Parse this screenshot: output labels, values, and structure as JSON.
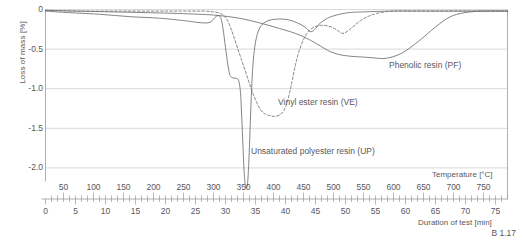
{
  "figure": {
    "caption": "B 1.17"
  },
  "chart_data": {
    "type": "line",
    "title": "",
    "ylabel": "Loss of mass [%]",
    "xlabel_top": "Temperature [°C]",
    "xlabel_bottom": "Duration of test [min]",
    "ylim": [
      -2.35,
      0.05
    ],
    "yticks": [
      0,
      -0.5,
      -1.0,
      -1.5,
      -2.0
    ],
    "ytick_labels": [
      "0",
      "-0.5",
      "-1.0",
      "-1.5",
      "-2.0"
    ],
    "grid": true,
    "legend_position": "inline-annotations",
    "x_top_axis": {
      "label": "Temperature [°C]",
      "range": [
        20,
        790
      ],
      "major_ticks": [
        50,
        100,
        150,
        200,
        250,
        300,
        350,
        400,
        450,
        500,
        550,
        600,
        650,
        700,
        750
      ],
      "tick_labels": [
        "50",
        "100",
        "150",
        "200",
        "250",
        "300",
        "350",
        "400",
        "450",
        "500",
        "550",
        "600",
        "650",
        "700",
        "750"
      ],
      "minor_tick_step": 10
    },
    "x_bottom_axis": {
      "label": "Duration of test [min]",
      "range": [
        0,
        76
      ],
      "major_ticks": [
        0,
        5,
        10,
        15,
        20,
        25,
        30,
        35,
        40,
        45,
        50,
        55,
        60,
        65,
        70,
        75
      ],
      "tick_labels": [
        "0",
        "5",
        "10",
        "15",
        "20",
        "25",
        "30",
        "35",
        "40",
        "45",
        "50",
        "55",
        "60",
        "65",
        "70",
        "75"
      ],
      "minor_tick_step": 1
    },
    "series": [
      {
        "name": "Unsaturated polyester resin (UP)",
        "short": "UP",
        "style": "solid",
        "color": "#6d6e70",
        "annotation": "Unsaturated polyester resin (UP)",
        "min_value": -2.25,
        "min_at_temperature": 352,
        "points": [
          [
            20,
            -0.02
          ],
          [
            60,
            -0.04
          ],
          [
            110,
            -0.06
          ],
          [
            160,
            -0.09
          ],
          [
            210,
            -0.11
          ],
          [
            250,
            -0.14
          ],
          [
            270,
            -0.16
          ],
          [
            285,
            -0.17
          ],
          [
            295,
            -0.16
          ],
          [
            300,
            -0.12
          ],
          [
            306,
            -0.08
          ],
          [
            312,
            -0.1
          ],
          [
            316,
            -0.25
          ],
          [
            320,
            -0.48
          ],
          [
            324,
            -0.7
          ],
          [
            327,
            -0.82
          ],
          [
            331,
            -0.86
          ],
          [
            338,
            -0.87
          ],
          [
            342,
            -0.9
          ],
          [
            345,
            -1.05
          ],
          [
            347,
            -1.35
          ],
          [
            349,
            -1.7
          ],
          [
            351,
            -2.05
          ],
          [
            353,
            -2.22
          ],
          [
            355,
            -2.25
          ],
          [
            357,
            -2.18
          ],
          [
            359,
            -1.9
          ],
          [
            361,
            -1.5
          ],
          [
            363,
            -1.1
          ],
          [
            365,
            -0.78
          ],
          [
            368,
            -0.52
          ],
          [
            372,
            -0.34
          ],
          [
            378,
            -0.22
          ],
          [
            386,
            -0.16
          ],
          [
            396,
            -0.13
          ],
          [
            410,
            -0.12
          ],
          [
            425,
            -0.13
          ],
          [
            440,
            -0.17
          ],
          [
            452,
            -0.22
          ],
          [
            462,
            -0.28
          ],
          [
            470,
            -0.24
          ],
          [
            478,
            -0.17
          ],
          [
            490,
            -0.11
          ],
          [
            505,
            -0.07
          ],
          [
            525,
            -0.04
          ],
          [
            550,
            -0.03
          ],
          [
            600,
            -0.02
          ],
          [
            660,
            -0.02
          ],
          [
            720,
            -0.02
          ],
          [
            790,
            -0.02
          ]
        ]
      },
      {
        "name": "Vinyl ester resin (VE)",
        "short": "VE",
        "style": "dashed",
        "color": "#6d6e70",
        "annotation": "Vinyl ester resin (VE)",
        "min_value": -1.35,
        "min_at_temperature": 403,
        "points": [
          [
            20,
            -0.01
          ],
          [
            80,
            -0.02
          ],
          [
            150,
            -0.02
          ],
          [
            220,
            -0.02
          ],
          [
            265,
            -0.02
          ],
          [
            285,
            -0.02
          ],
          [
            300,
            -0.03
          ],
          [
            312,
            -0.05
          ],
          [
            322,
            -0.12
          ],
          [
            330,
            -0.26
          ],
          [
            338,
            -0.44
          ],
          [
            346,
            -0.62
          ],
          [
            354,
            -0.8
          ],
          [
            362,
            -0.98
          ],
          [
            370,
            -1.14
          ],
          [
            378,
            -1.26
          ],
          [
            386,
            -1.32
          ],
          [
            394,
            -1.34
          ],
          [
            402,
            -1.35
          ],
          [
            410,
            -1.33
          ],
          [
            417,
            -1.28
          ],
          [
            424,
            -1.14
          ],
          [
            430,
            -0.94
          ],
          [
            436,
            -0.72
          ],
          [
            442,
            -0.54
          ],
          [
            450,
            -0.38
          ],
          [
            458,
            -0.28
          ],
          [
            468,
            -0.22
          ],
          [
            480,
            -0.2
          ],
          [
            492,
            -0.21
          ],
          [
            504,
            -0.25
          ],
          [
            514,
            -0.3
          ],
          [
            522,
            -0.28
          ],
          [
            532,
            -0.22
          ],
          [
            545,
            -0.14
          ],
          [
            560,
            -0.08
          ],
          [
            578,
            -0.04
          ],
          [
            600,
            -0.02
          ],
          [
            640,
            -0.02
          ],
          [
            700,
            -0.02
          ],
          [
            790,
            -0.02
          ]
        ]
      },
      {
        "name": "Phenolic resin (PF)",
        "short": "PF",
        "style": "solid",
        "color": "#6d6e70",
        "annotation": "Phenolic resin (PF)",
        "min_value": -0.62,
        "min_at_temperature": 580,
        "points": [
          [
            20,
            -0.01
          ],
          [
            70,
            -0.02
          ],
          [
            130,
            -0.03
          ],
          [
            190,
            -0.04
          ],
          [
            240,
            -0.05
          ],
          [
            275,
            -0.06
          ],
          [
            300,
            -0.07
          ],
          [
            325,
            -0.09
          ],
          [
            350,
            -0.12
          ],
          [
            372,
            -0.16
          ],
          [
            392,
            -0.2
          ],
          [
            410,
            -0.24
          ],
          [
            428,
            -0.28
          ],
          [
            446,
            -0.33
          ],
          [
            462,
            -0.39
          ],
          [
            478,
            -0.46
          ],
          [
            494,
            -0.53
          ],
          [
            510,
            -0.57
          ],
          [
            528,
            -0.59
          ],
          [
            548,
            -0.6
          ],
          [
            566,
            -0.61
          ],
          [
            582,
            -0.62
          ],
          [
            598,
            -0.6
          ],
          [
            614,
            -0.55
          ],
          [
            628,
            -0.48
          ],
          [
            642,
            -0.4
          ],
          [
            656,
            -0.31
          ],
          [
            670,
            -0.22
          ],
          [
            684,
            -0.14
          ],
          [
            698,
            -0.08
          ],
          [
            712,
            -0.05
          ],
          [
            728,
            -0.03
          ],
          [
            748,
            -0.02
          ],
          [
            770,
            -0.02
          ],
          [
            790,
            -0.02
          ]
        ]
      }
    ],
    "annotations": [
      {
        "text": "Phenolic resin (PF)",
        "x_px": 389,
        "y_px": 61
      },
      {
        "text": "Vinyl ester resin (VE)",
        "x_px": 278,
        "y_px": 98
      },
      {
        "text": "Unsaturated polyester resin (UP)",
        "x_px": 251,
        "y_px": 147
      }
    ]
  }
}
